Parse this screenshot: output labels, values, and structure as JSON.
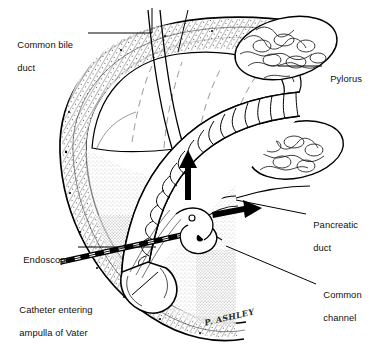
{
  "figure": {
    "style": "black-and-white pen-and-ink medical line drawing",
    "background_color": "#ffffff",
    "ink_color": "#000000",
    "signature": "P. ASHLEY"
  },
  "labels": [
    {
      "id": "common-bile-duct",
      "line1": "Common bile",
      "line2": "duct",
      "x": 12,
      "y": 28,
      "align": "left"
    },
    {
      "id": "pylorus",
      "line1": "Pylorus",
      "line2": "",
      "x": 325,
      "y": 62,
      "align": "left"
    },
    {
      "id": "pancreatic-duct",
      "line1": "Pancreatic",
      "line2": "duct",
      "x": 308,
      "y": 208,
      "align": "left"
    },
    {
      "id": "common-channel",
      "line1": "Common",
      "line2": "channel",
      "x": 318,
      "y": 278,
      "align": "left"
    },
    {
      "id": "endoscope",
      "line1": "Endoscope",
      "line2": "",
      "x": 18,
      "y": 243,
      "align": "left"
    },
    {
      "id": "catheter-ampulla",
      "line1": "Catheter entering",
      "line2": "ampulla of Vater",
      "x": 14,
      "y": 293,
      "align": "left"
    }
  ],
  "leaders": [
    {
      "id": "leader-common-bile-duct-a",
      "from": [
        88,
        33
      ],
      "to": [
        152,
        33
      ],
      "note": "horizontal to duct, then up"
    },
    {
      "id": "leader-common-bile-duct-b",
      "from": [
        152,
        33
      ],
      "to": [
        152,
        8
      ],
      "note": "riser"
    },
    {
      "id": "leader-common-bile-duct-c",
      "from": [
        178,
        52
      ],
      "to": [
        188,
        10
      ],
      "note": "second riser"
    },
    {
      "id": "leader-pylorus",
      "from": [
        322,
        66
      ],
      "to": [
        278,
        66
      ],
      "note": "to pyloric ring"
    },
    {
      "id": "leader-pancreatic-duct",
      "from": [
        306,
        214
      ],
      "to": [
        236,
        200
      ],
      "note": "to pancreatic duct"
    },
    {
      "id": "leader-common-channel",
      "from": [
        316,
        284
      ],
      "to": [
        226,
        246
      ],
      "note": "to common channel"
    },
    {
      "id": "leader-endoscope",
      "from": [
        78,
        247
      ],
      "to": [
        156,
        247
      ],
      "note": "to scope shaft"
    },
    {
      "id": "leader-catheter",
      "from": [
        132,
        295
      ],
      "to": [
        158,
        272
      ],
      "note": "to catheter tip"
    }
  ],
  "arrows": [
    {
      "id": "arrow-bile-flow",
      "direction": "up",
      "x": 188,
      "y": 158,
      "length": 42,
      "meaning": "contrast flow up common bile duct"
    },
    {
      "id": "arrow-pancreatic-flow",
      "direction": "right",
      "x": 214,
      "y": 208,
      "length": 40,
      "meaning": "contrast flow into pancreatic duct"
    }
  ],
  "structures": [
    {
      "id": "duodenal-wall",
      "name": "Duodenum wall (C-loop)"
    },
    {
      "id": "stomach-antrum",
      "name": "Gastric antrum"
    },
    {
      "id": "pylorus-ring",
      "name": "Pylorus"
    },
    {
      "id": "pancreas-upper",
      "name": "Pancreas, upper lobule mass"
    },
    {
      "id": "pancreas-lower",
      "name": "Pancreas, lower lobule mass"
    },
    {
      "id": "endoscope-shaft",
      "name": "Flexible endoscope, ribbed shaft"
    },
    {
      "id": "endoscope-tip",
      "name": "Endoscope distal tip"
    },
    {
      "id": "catheter",
      "name": "Cannulating catheter, banded"
    },
    {
      "id": "ampulla",
      "name": "Ampulla of Vater / papilla"
    },
    {
      "id": "bile-duct",
      "name": "Common bile duct"
    },
    {
      "id": "pancreatic-duct",
      "name": "Pancreatic duct"
    },
    {
      "id": "common-channel",
      "name": "Common channel"
    }
  ]
}
